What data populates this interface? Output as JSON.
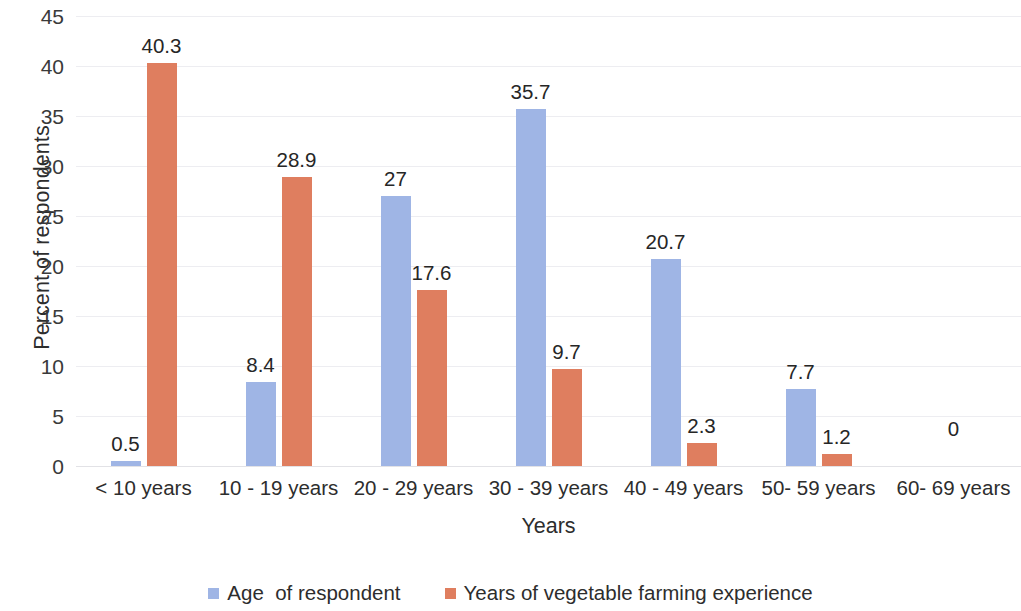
{
  "chart_data": {
    "type": "bar",
    "title": "",
    "xlabel": "Years",
    "ylabel": "Percent of respondents",
    "ylim": [
      0,
      45
    ],
    "ytick_step": 5,
    "yticks": [
      "45",
      "40",
      "35",
      "30",
      "25",
      "20",
      "15",
      "10",
      "5",
      "0"
    ],
    "grid": true,
    "legend_position": "bottom",
    "categories": [
      "< 10 years",
      "10 - 19 years",
      "20 - 29 years",
      "30 - 39 years",
      "40 - 49 years",
      "50- 59 years",
      "60- 69 years"
    ],
    "series": [
      {
        "name": "Age  of respondent",
        "color": "#9fb5e5",
        "values": [
          0.5,
          8.4,
          27,
          35.7,
          20.7,
          7.7,
          null
        ],
        "labels": [
          "0.5",
          "8.4",
          "27",
          "35.7",
          "20.7",
          "7.7",
          ""
        ]
      },
      {
        "name": "Years of vegetable farming experience",
        "color": "#df7e5f",
        "values": [
          40.3,
          28.9,
          17.6,
          9.7,
          2.3,
          1.2,
          null
        ],
        "labels": [
          "40.3",
          "28.9",
          "17.6",
          "9.7",
          "2.3",
          "1.2",
          ""
        ]
      }
    ],
    "extra_labels": [
      {
        "text": "0",
        "category_index": 6,
        "note": "zero label shown for 60- 69 years category"
      }
    ]
  },
  "legend": {
    "items": [
      {
        "label": "Age  of respondent",
        "color": "#9fb5e5"
      },
      {
        "label": "Years of vegetable farming experience",
        "color": "#df7e5f"
      }
    ]
  },
  "axes": {
    "y_title": "Percent of respondents",
    "x_title": "Years"
  }
}
